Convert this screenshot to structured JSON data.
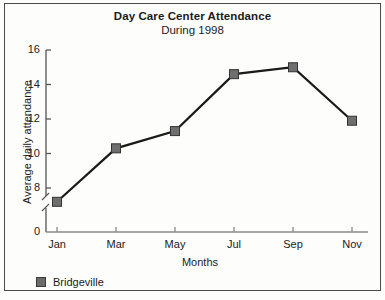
{
  "figure": {
    "border_color": "#4a4a4a",
    "background": "#fdfdfb"
  },
  "chart_data": {
    "type": "line",
    "title": "Day Care Center Attendance",
    "subtitle": "During 1998",
    "xlabel": "Months",
    "ylabel": "Average daily attendance",
    "categories": [
      "Jan",
      "Mar",
      "May",
      "Jul",
      "Sep",
      "Nov"
    ],
    "series": [
      {
        "name": "Bridgeville",
        "values": [
          7.2,
          10.3,
          11.3,
          14.6,
          15.0,
          11.9
        ],
        "marker": "square",
        "marker_color": "#6f6f6f",
        "marker_edge_color": "#333333",
        "line_color": "#1a1a1a"
      }
    ],
    "ylim": [
      0,
      16
    ],
    "yticks": [
      0,
      8,
      10,
      12,
      14,
      16
    ],
    "ytick_labels": [
      "0",
      "8",
      "10",
      "12",
      "14",
      "16"
    ],
    "y_axis_break": true,
    "y_axis_break_between": [
      0,
      8
    ],
    "grid": false,
    "legend_position": "below-left"
  },
  "legend": {
    "entries": [
      {
        "label": "Bridgeville",
        "color": "#6b6b6b"
      }
    ]
  }
}
